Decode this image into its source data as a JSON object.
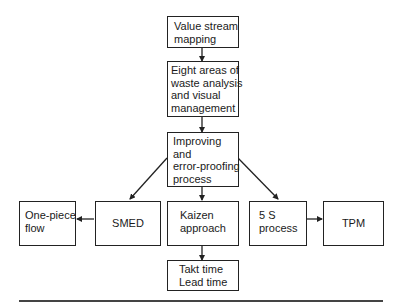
{
  "diagram": {
    "type": "flowchart",
    "nodes": [
      {
        "id": "vsm",
        "lines": [
          "Value stream",
          "mapping"
        ]
      },
      {
        "id": "eight",
        "lines": [
          "Eight areas of",
          "waste analysis",
          "and visual",
          "management"
        ]
      },
      {
        "id": "improve",
        "lines": [
          "Improving",
          "and",
          "error-proofing",
          "process"
        ]
      },
      {
        "id": "onepiece",
        "lines": [
          "One-piece",
          "flow"
        ]
      },
      {
        "id": "smed",
        "lines": [
          "SMED"
        ]
      },
      {
        "id": "kaizen",
        "lines": [
          "Kaizen",
          "approach"
        ]
      },
      {
        "id": "fives",
        "lines": [
          "5 S",
          "process"
        ]
      },
      {
        "id": "tpm",
        "lines": [
          "TPM"
        ]
      },
      {
        "id": "takt",
        "lines": [
          "Takt time",
          "Lead time"
        ]
      }
    ],
    "edges": [
      {
        "from": "vsm",
        "to": "eight"
      },
      {
        "from": "eight",
        "to": "improve"
      },
      {
        "from": "improve",
        "to": "smed"
      },
      {
        "from": "improve",
        "to": "kaizen"
      },
      {
        "from": "improve",
        "to": "fives"
      },
      {
        "from": "smed",
        "to": "onepiece"
      },
      {
        "from": "fives",
        "to": "tpm"
      },
      {
        "from": "kaizen",
        "to": "takt"
      }
    ]
  }
}
